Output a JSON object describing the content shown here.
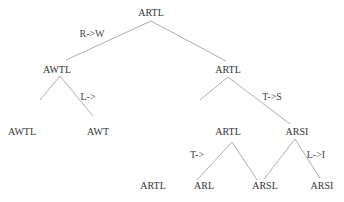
{
  "tree": {
    "nodes": [
      {
        "id": "n0",
        "label": "ARTL",
        "x": 151,
        "y": 13
      },
      {
        "id": "n1",
        "label": "AWTL",
        "x": 57,
        "y": 70
      },
      {
        "id": "n2",
        "label": "ARTL",
        "x": 228,
        "y": 70
      },
      {
        "id": "n3",
        "label": "AWTL",
        "x": 22,
        "y": 132
      },
      {
        "id": "n4",
        "label": "AWT",
        "x": 98,
        "y": 132
      },
      {
        "id": "n5",
        "label": "ARTL",
        "x": 228,
        "y": 132
      },
      {
        "id": "n6",
        "label": "ARSI",
        "x": 297,
        "y": 132
      },
      {
        "id": "n7",
        "label": "ARTL",
        "x": 153,
        "y": 186
      },
      {
        "id": "n8",
        "label": "ARL",
        "x": 204,
        "y": 186
      },
      {
        "id": "n9",
        "label": "ARSL",
        "x": 265,
        "y": 186
      },
      {
        "id": "n10",
        "label": "ARSI",
        "x": 322,
        "y": 186
      }
    ],
    "edges": [
      {
        "from": "n0",
        "to": "n1",
        "x1": 151,
        "y1": 21,
        "x2": 66,
        "y2": 60
      },
      {
        "from": "n0",
        "to": "n2",
        "x1": 151,
        "y1": 21,
        "x2": 226,
        "y2": 61
      },
      {
        "from": "n1",
        "to": "n3",
        "x1": 60,
        "y1": 76,
        "x2": 40,
        "y2": 100
      },
      {
        "from": "n1",
        "to": "n4",
        "x1": 60,
        "y1": 76,
        "x2": 93,
        "y2": 116
      },
      {
        "from": "n2",
        "to": "n5",
        "x1": 228,
        "y1": 77,
        "x2": 200,
        "y2": 100
      },
      {
        "from": "n2",
        "to": "n6",
        "x1": 228,
        "y1": 77,
        "x2": 290,
        "y2": 124
      },
      {
        "from": "n5",
        "to": "n7",
        "x1": 232,
        "y1": 142,
        "x2": 197,
        "y2": 180
      },
      {
        "from": "n5",
        "to": "n8",
        "x1": 232,
        "y1": 142,
        "x2": 257,
        "y2": 180
      },
      {
        "from": "n6",
        "to": "n9",
        "x1": 295,
        "y1": 139,
        "x2": 264,
        "y2": 179
      },
      {
        "from": "n6",
        "to": "n10",
        "x1": 295,
        "y1": 139,
        "x2": 320,
        "y2": 178
      }
    ],
    "edge_labels": [
      {
        "label": "R->W",
        "x": 92,
        "y": 34
      },
      {
        "label": "L->",
        "x": 88,
        "y": 97
      },
      {
        "label": "T->S",
        "x": 272,
        "y": 97
      },
      {
        "label": "T->",
        "x": 197,
        "y": 155
      },
      {
        "label": "L->I",
        "x": 316,
        "y": 155
      }
    ]
  },
  "colors": {
    "line": "#999999",
    "text": "#333333",
    "background": "#ffffff"
  }
}
